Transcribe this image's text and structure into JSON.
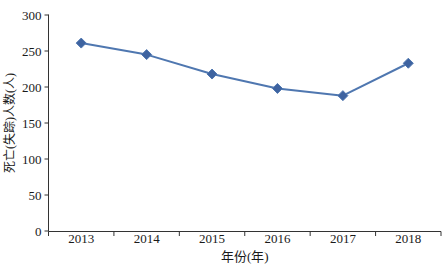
{
  "chart_data": {
    "type": "line",
    "categories": [
      "2013",
      "2014",
      "2015",
      "2016",
      "2017",
      "2018"
    ],
    "series": [
      {
        "name": "死亡(失踪)人数",
        "values": [
          261,
          245,
          218,
          198,
          188,
          233
        ]
      }
    ],
    "title": "",
    "xlabel": "年份(年)",
    "ylabel": "死亡(失踪)人数(人)",
    "ylim": [
      0,
      300
    ],
    "ytick_step": 50,
    "yticks": [
      0,
      50,
      100,
      150,
      200,
      250,
      300
    ],
    "grid": false,
    "legend_position": "none",
    "marker": "diamond",
    "colors": {
      "line": "#4F77B0",
      "marker_fill": "#3E63A0",
      "axis": "#333333",
      "text": "#1a1a1a"
    }
  }
}
